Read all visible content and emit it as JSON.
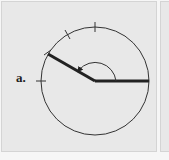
{
  "panel_a": {
    "label": "a.",
    "circle": {
      "cx": 95,
      "cy": 81,
      "r": 54
    },
    "angle_degrees": 150,
    "rays": [
      {
        "name": "initial-side",
        "angle": 0
      },
      {
        "name": "terminal-side",
        "angle": 150
      }
    ],
    "tick_marks_degrees": [
      90,
      120,
      150,
      180
    ],
    "arc": {
      "radius": 21,
      "direction": "counterclockwise",
      "from": 0,
      "to": 150
    },
    "colors": {
      "background": "#e8e8e8",
      "stroke": "#222222"
    }
  },
  "panel_b": {
    "visible": "partial"
  }
}
